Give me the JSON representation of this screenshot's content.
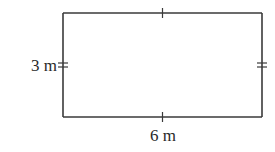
{
  "figure": {
    "shape": "rectangle",
    "labels": {
      "left_side": "3 m",
      "bottom_side": "6 m"
    },
    "tick_marks": {
      "top_side": 1,
      "bottom_side": 1,
      "left_side": 2,
      "right_side": 2
    },
    "colors": {
      "stroke": "#3a3a3a",
      "text": "#2a2a2a",
      "background": "#ffffff"
    }
  }
}
